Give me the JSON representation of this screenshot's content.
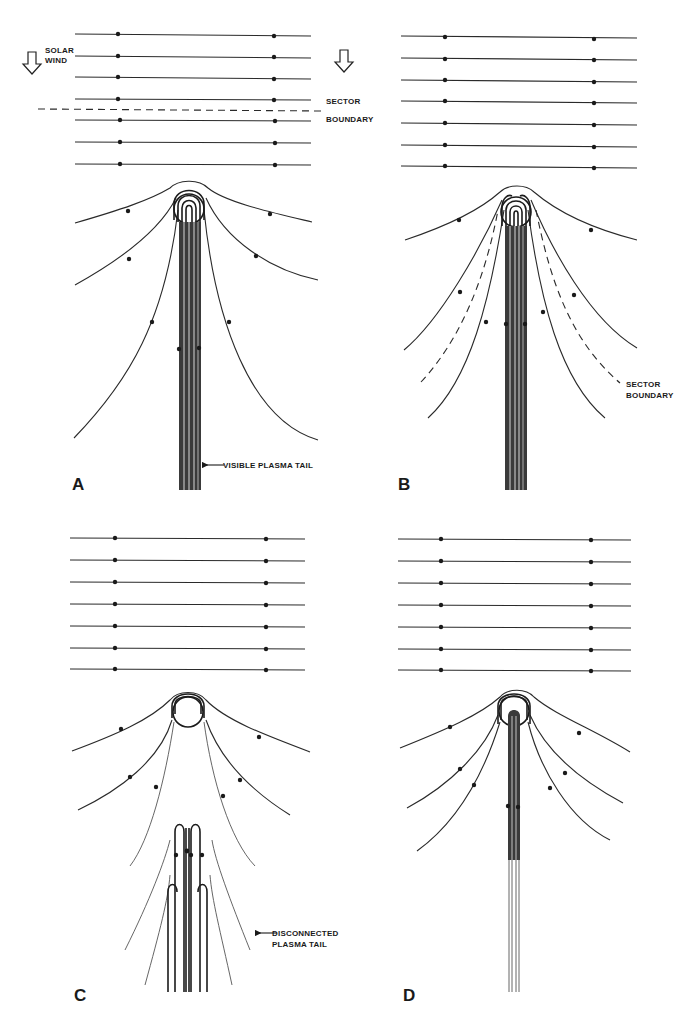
{
  "figure": {
    "panels": [
      {
        "id": "A",
        "letter": "A",
        "labels": {
          "solar_wind_line1": "SOLAR",
          "solar_wind_line2": "WIND",
          "sector_line1": "SECTOR",
          "sector_line2": "BOUNDARY",
          "tail": "VISIBLE PLASMA TAIL"
        }
      },
      {
        "id": "B",
        "letter": "B",
        "labels": {
          "sector_line1": "SECTOR",
          "sector_line2": "BOUNDARY"
        }
      },
      {
        "id": "C",
        "letter": "C",
        "labels": {
          "tail_line1": "DISCONNECTED",
          "tail_line2": "PLASMA TAIL"
        }
      },
      {
        "id": "D",
        "letter": "D",
        "labels": {}
      }
    ],
    "icons": {
      "solar_wind_arrow_left": "down-arrow-icon",
      "solar_wind_arrow_right": "down-arrow-icon",
      "tail_pointer": "left-arrow-icon"
    },
    "colors": {
      "background": "#ffffff",
      "ink": "#1a1a1a"
    }
  }
}
